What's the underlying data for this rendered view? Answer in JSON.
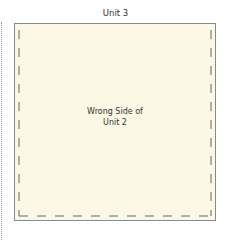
{
  "diagram": {
    "top_label": "Unit 3",
    "center_label_line1": "Wrong Side of",
    "center_label_line2": "Unit 2",
    "colors": {
      "fabric_fill": "#fbf9e6",
      "outline": "#8a8a8a",
      "seam_dash": "#555555",
      "text": "#333333"
    }
  }
}
